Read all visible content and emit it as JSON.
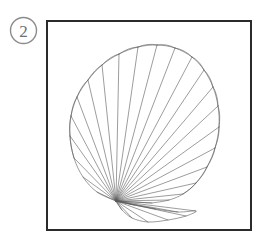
{
  "page": {
    "background_color": "#ffffff",
    "width": 266,
    "height": 240
  },
  "figure": {
    "label": {
      "text": "2",
      "shape": "circle",
      "stroke_color": "#8c8c8c",
      "text_color": "#6e6e6e",
      "center_x": 23.5,
      "center_y": 30.5,
      "radius": 13
    },
    "frame": {
      "name": "figure-border",
      "x": 46,
      "y": 20,
      "width": 206,
      "height": 211,
      "stroke_color": "#2b2b2b",
      "stroke_width": 2,
      "fill_color": "#ffffff"
    },
    "illustration": {
      "name": "scallop-shell",
      "description": "line drawing of a scallop seashell",
      "stroke_color": "#5a5a5a",
      "stroke_width": 0.6,
      "fill_color": "none",
      "hinge_x": 116,
      "hinge_y": 201,
      "rib_count": 24,
      "bounds": {
        "left": 70,
        "top": 44,
        "right": 219,
        "bottom": 222
      },
      "outline_points": [
        [
          116,
          201
        ],
        [
          97,
          192
        ],
        [
          83,
          177
        ],
        [
          74,
          158
        ],
        [
          70,
          136
        ],
        [
          71,
          116
        ],
        [
          77,
          97
        ],
        [
          88,
          80
        ],
        [
          102,
          65
        ],
        [
          119,
          54
        ],
        [
          138,
          47
        ],
        [
          157,
          45
        ],
        [
          175,
          48
        ],
        [
          192,
          57
        ],
        [
          204,
          70
        ],
        [
          213,
          87
        ],
        [
          218,
          106
        ],
        [
          219,
          127
        ],
        [
          215,
          148
        ],
        [
          207,
          167
        ],
        [
          196,
          183
        ],
        [
          183,
          194
        ],
        [
          169,
          200
        ],
        [
          152,
          203
        ]
      ],
      "scallop_edge_count": 14,
      "lower_lobe_points": [
        [
          116,
          201
        ],
        [
          134,
          205
        ],
        [
          156,
          209
        ],
        [
          178,
          212
        ],
        [
          196,
          211
        ],
        [
          186,
          216
        ],
        [
          168,
          220
        ],
        [
          148,
          222
        ],
        [
          132,
          218
        ],
        [
          122,
          210
        ]
      ]
    }
  }
}
